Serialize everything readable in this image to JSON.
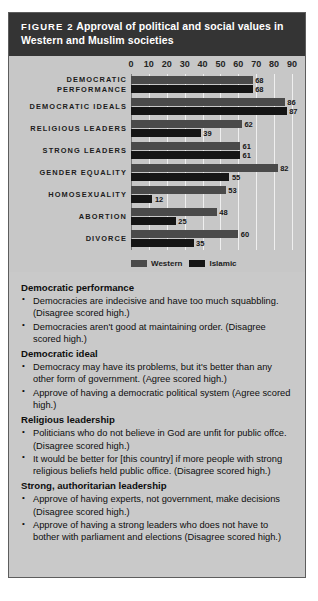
{
  "figure": {
    "label": "FIGURE 2",
    "title": "Approval of political and social values in Western and Muslim societies"
  },
  "chart_data": {
    "type": "bar",
    "orientation": "horizontal",
    "title": "Approval of political and social values in Western and Muslim societies",
    "xlabel": "",
    "ylabel": "",
    "xlim": [
      0,
      90
    ],
    "ticks": [
      0,
      10,
      20,
      30,
      40,
      50,
      60,
      70,
      80,
      90
    ],
    "grid": true,
    "legend_position": "bottom-left",
    "categories": [
      "DEMOCRATIC PERFORMANCE",
      "DEMOCRATIC IDEALS",
      "RELIGIOUS LEADERS",
      "STRONG LEADERS",
      "GENDER EQUALITY",
      "HOMOSEXUALITY",
      "ABORTION",
      "DIVORCE"
    ],
    "series": [
      {
        "name": "Western",
        "color": "#4a4a4a",
        "values": [
          68,
          86,
          62,
          61,
          82,
          53,
          48,
          60
        ]
      },
      {
        "name": "Islamic",
        "color": "#151515",
        "values": [
          68,
          87,
          39,
          61,
          55,
          12,
          25,
          35
        ]
      }
    ]
  },
  "notes": [
    {
      "heading": "Democratic performance",
      "items": [
        "Democracies are indecisive and have too much squabbling. (Disagree scored high.)",
        "Democracies aren't good at maintaining order. (Disagree scored high.)"
      ]
    },
    {
      "heading": "Democratic ideal",
      "items": [
        "Democracy may have its problems, but it's better than any other form of government. (Agree scored high.)",
        "Approve of having a democratic political system (Agree scored high.)"
      ]
    },
    {
      "heading": "Religious leadership",
      "items": [
        "Politicians who do not believe in God are unfit for public offce. (Disagree scored high.)",
        "It would be better for [this country] if more people with strong religious beliefs held public office. (Disagree scored high.)"
      ]
    },
    {
      "heading": "Strong, authoritarian leadership",
      "items": [
        "Approve of having experts, not government, make decisions (Disagree scored high.)",
        "Approve of having a strong leaders who does not have to bother with parliament and elections (Disagree scored high.)"
      ]
    }
  ]
}
